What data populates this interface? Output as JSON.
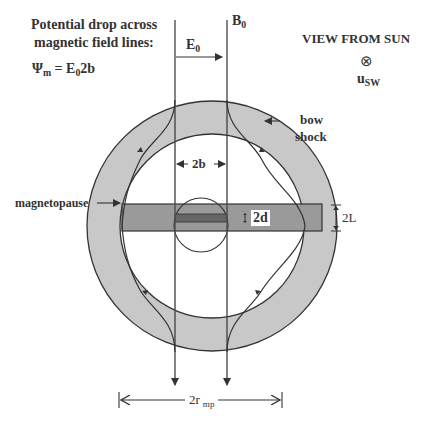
{
  "title_block": {
    "line1": "Potential drop across",
    "line2": "magnetic field lines:",
    "formula_lhs": "Ψ",
    "formula_lhs_sub": "m",
    "formula_eq": " = E",
    "formula_sub": "0",
    "formula_rhs": "2b"
  },
  "view": {
    "label": "VIEW FROM SUN",
    "symbol": "⊗",
    "velocity": "u",
    "velocity_sub": "SW"
  },
  "field_labels": {
    "B": "B",
    "B_sub": "0",
    "E": "E",
    "E_sub": "0"
  },
  "regions": {
    "bow_shock_line1": "bow",
    "bow_shock_line2": "shock",
    "magnetopause": "magnetopause"
  },
  "dimensions": {
    "width_2b": "2b",
    "thickness_2d": "2d",
    "height_2L": "2L",
    "radius_label": "2r",
    "radius_sub": "mp"
  },
  "colors": {
    "sheath": "#c8c8c8",
    "band": "#9a9a9a",
    "sheet": "#666666",
    "lines": "#333333"
  }
}
